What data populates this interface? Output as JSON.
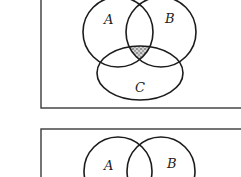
{
  "diagrams": [
    {
      "id": "top",
      "frame": {
        "x": 41,
        "y": -10,
        "width": 215,
        "height": 118
      },
      "sets": [
        {
          "label": "A",
          "cx": 118,
          "cy": 32,
          "r": 35,
          "label_x": 104,
          "label_y": 24
        },
        {
          "label": "B",
          "cx": 161,
          "cy": 32,
          "r": 35,
          "label_x": 165,
          "label_y": 23
        },
        {
          "label": "C",
          "cx": 140,
          "cy": 73,
          "r": 43,
          "ry": 27,
          "label_x": 135,
          "label_y": 91
        }
      ],
      "shaded_region": "A ∩ B ∩ C",
      "shade_color": "#6a6a6a"
    },
    {
      "id": "bottom",
      "frame": {
        "x": 41,
        "y": 129,
        "width": 215,
        "height": 80
      },
      "sets": [
        {
          "label": "A",
          "cx": 118,
          "cy": 170,
          "r": 34,
          "label_x": 104,
          "label_y": 170
        },
        {
          "label": "B",
          "cx": 161,
          "cy": 170,
          "r": 34,
          "label_x": 167,
          "label_y": 168
        }
      ],
      "shaded_region": ""
    }
  ],
  "labels": {
    "top_a": "A",
    "top_b": "B",
    "top_c": "C",
    "bottom_a": "A",
    "bottom_b": "B"
  }
}
